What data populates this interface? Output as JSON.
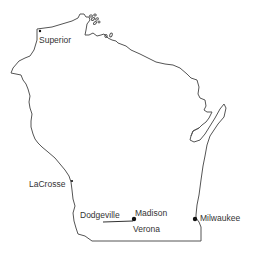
{
  "map": {
    "region": "Wisconsin",
    "outline_color": "#555555",
    "cities": [
      {
        "name": "Superior",
        "x": 40,
        "y": 31,
        "label_x": 39,
        "label_y": 36,
        "marker": "small"
      },
      {
        "name": "LaCrosse",
        "x": 71,
        "y": 182,
        "label_x": 29,
        "label_y": 179,
        "marker": "small"
      },
      {
        "name": "Dodgeville",
        "x": 104,
        "y": 221,
        "label_x": 80,
        "label_y": 211,
        "marker": "none"
      },
      {
        "name": "Madison",
        "x": 135,
        "y": 218,
        "label_x": 134,
        "label_y": 208,
        "marker": "large"
      },
      {
        "name": "Verona",
        "x": 135,
        "y": 218,
        "label_x": 133,
        "label_y": 225,
        "marker": "none"
      },
      {
        "name": "Milwaukee",
        "x": 194,
        "y": 219,
        "label_x": 200,
        "label_y": 214,
        "marker": "large"
      }
    ],
    "route": {
      "from": "Dodgeville",
      "to": "Madison"
    }
  },
  "labels": {
    "superior": "Superior",
    "lacrosse": "LaCrosse",
    "dodgeville": "Dodgeville",
    "madison": "Madison",
    "verona": "Verona",
    "milwaukee": "Milwaukee"
  }
}
